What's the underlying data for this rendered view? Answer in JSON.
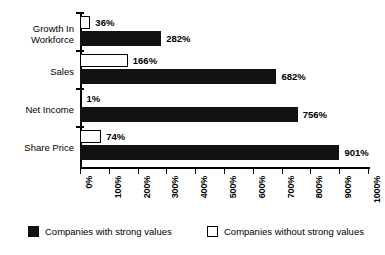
{
  "chart_data": {
    "type": "bar",
    "orientation": "horizontal",
    "title": "",
    "xlabel": "",
    "ylabel": "",
    "categories": [
      "Growth In\nWorkforce",
      "Sales",
      "Net Income",
      "Share Price"
    ],
    "series": [
      {
        "name": "Companies with strong values",
        "color": "#111111",
        "values": [
          282,
          682,
          756,
          901
        ],
        "value_labels": [
          "282%",
          "682%",
          "756%",
          "901%"
        ]
      },
      {
        "name": "Companies without strong values",
        "color": "#ffffff",
        "values": [
          36,
          166,
          1,
          74
        ],
        "value_labels": [
          "36%",
          "166%",
          "1%",
          "74%"
        ]
      }
    ],
    "xlim": [
      0,
      1000
    ],
    "xticks": [
      0,
      100,
      200,
      300,
      400,
      500,
      600,
      700,
      800,
      900,
      1000
    ],
    "xtick_labels": [
      "0%",
      "100%",
      "200%",
      "300%",
      "400%",
      "500%",
      "600%",
      "700%",
      "800%",
      "900%",
      "1000%"
    ],
    "grid": false,
    "legend_position": "bottom"
  },
  "legend": {
    "items": [
      {
        "label": "Companies with strong values",
        "swatch": "dark"
      },
      {
        "label": "Companies without strong values",
        "swatch": "light"
      }
    ]
  }
}
